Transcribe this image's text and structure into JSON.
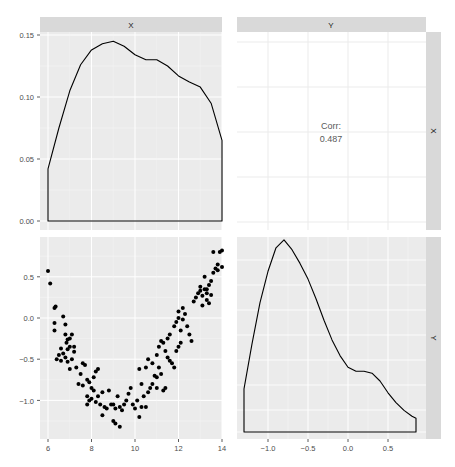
{
  "chart_data": [
    {
      "panel": "top-left",
      "type": "area",
      "title": "",
      "strip_top": "X",
      "xlabel": "",
      "ylabel": "",
      "description": "Density of X",
      "y_ticks": [
        "0.00",
        "0.05",
        "0.10",
        "0.15"
      ],
      "ylim": [
        0,
        0.155
      ],
      "xlim": [
        5.8,
        14.2
      ],
      "x": [
        6.0,
        6.5,
        7.0,
        7.5,
        8.0,
        8.5,
        9.0,
        9.5,
        10.0,
        10.5,
        11.0,
        11.5,
        12.0,
        12.5,
        13.0,
        13.5,
        14.0
      ],
      "values": [
        0.042,
        0.075,
        0.105,
        0.126,
        0.138,
        0.143,
        0.145,
        0.141,
        0.134,
        0.13,
        0.13,
        0.125,
        0.117,
        0.112,
        0.108,
        0.095,
        0.065
      ],
      "grid": true
    },
    {
      "panel": "top-right",
      "type": "table",
      "strip_top": "Y",
      "strip_right": "X",
      "label": "Corr:",
      "value": "0.487"
    },
    {
      "panel": "bottom-left",
      "type": "scatter",
      "xlabel": "",
      "ylabel": "",
      "x_ticks": [
        "6",
        "8",
        "10",
        "12",
        "14"
      ],
      "y_ticks": [
        "-1.0",
        "-0.5",
        "0.0",
        "0.5"
      ],
      "xlim": [
        5.8,
        14.2
      ],
      "ylim": [
        -1.35,
        0.9
      ],
      "grid": true,
      "points": [
        [
          6.0,
          0.57
        ],
        [
          6.1,
          0.42
        ],
        [
          6.3,
          0.12
        ],
        [
          6.35,
          0.14
        ],
        [
          6.3,
          -0.06
        ],
        [
          6.3,
          -0.15
        ],
        [
          6.7,
          0.02
        ],
        [
          6.8,
          -0.08
        ],
        [
          6.8,
          -0.2
        ],
        [
          6.9,
          -0.26
        ],
        [
          6.85,
          -0.3
        ],
        [
          7.0,
          -0.25
        ],
        [
          6.9,
          -0.38
        ],
        [
          7.0,
          -0.35
        ],
        [
          7.2,
          -0.35
        ],
        [
          7.1,
          -0.2
        ],
        [
          6.6,
          -0.37
        ],
        [
          6.5,
          -0.45
        ],
        [
          6.4,
          -0.5
        ],
        [
          6.7,
          -0.43
        ],
        [
          6.6,
          -0.52
        ],
        [
          6.9,
          -0.53
        ],
        [
          6.8,
          -0.48
        ],
        [
          7.1,
          -0.5
        ],
        [
          7.2,
          -0.41
        ],
        [
          7.3,
          -0.6
        ],
        [
          7.0,
          -0.62
        ],
        [
          7.5,
          -0.68
        ],
        [
          7.6,
          -0.55
        ],
        [
          7.7,
          -0.57
        ],
        [
          7.4,
          -0.8
        ],
        [
          7.6,
          -0.82
        ],
        [
          7.8,
          -0.75
        ],
        [
          7.9,
          -0.78
        ],
        [
          8.0,
          -0.85
        ],
        [
          8.1,
          -0.88
        ],
        [
          8.2,
          -0.65
        ],
        [
          8.3,
          -0.62
        ],
        [
          8.1,
          -0.72
        ],
        [
          7.8,
          -0.95
        ],
        [
          7.9,
          -1.0
        ],
        [
          7.8,
          -1.05
        ],
        [
          8.0,
          -0.98
        ],
        [
          8.2,
          -1.02
        ],
        [
          8.3,
          -0.95
        ],
        [
          8.4,
          -1.05
        ],
        [
          8.5,
          -0.9
        ],
        [
          8.6,
          -1.08
        ],
        [
          8.7,
          -1.1
        ],
        [
          8.5,
          -1.18
        ],
        [
          8.8,
          -0.88
        ],
        [
          8.9,
          -1.05
        ],
        [
          9.0,
          -1.05
        ],
        [
          9.1,
          -1.1
        ],
        [
          9.2,
          -0.95
        ],
        [
          9.3,
          -1.08
        ],
        [
          9.4,
          -1.12
        ],
        [
          9.0,
          -1.25
        ],
        [
          9.1,
          -1.28
        ],
        [
          9.3,
          -1.32
        ],
        [
          9.5,
          -1.05
        ],
        [
          9.6,
          -1.0
        ],
        [
          9.7,
          -0.92
        ],
        [
          9.8,
          -0.85
        ],
        [
          9.9,
          -1.05
        ],
        [
          10.0,
          -1.1
        ],
        [
          10.1,
          -1.0
        ],
        [
          10.2,
          -1.2
        ],
        [
          10.3,
          -1.08
        ],
        [
          10.4,
          -0.95
        ],
        [
          10.5,
          -1.08
        ],
        [
          10.6,
          -0.9
        ],
        [
          10.7,
          -0.85
        ],
        [
          10.8,
          -0.8
        ],
        [
          10.9,
          -0.7
        ],
        [
          11.0,
          -0.72
        ],
        [
          10.3,
          -0.8
        ],
        [
          10.2,
          -0.62
        ],
        [
          10.5,
          -0.6
        ],
        [
          10.6,
          -0.5
        ],
        [
          10.8,
          -0.55
        ],
        [
          11.0,
          -0.45
        ],
        [
          11.1,
          -0.6
        ],
        [
          11.2,
          -0.68
        ],
        [
          11.3,
          -0.88
        ],
        [
          11.4,
          -0.85
        ],
        [
          11.0,
          -0.85
        ],
        [
          11.1,
          -0.35
        ],
        [
          11.3,
          -0.3
        ],
        [
          11.4,
          -0.4
        ],
        [
          11.5,
          -0.48
        ],
        [
          11.6,
          -0.52
        ],
        [
          11.7,
          -0.55
        ],
        [
          11.8,
          -0.6
        ],
        [
          11.9,
          -0.4
        ],
        [
          12.0,
          -0.35
        ],
        [
          12.1,
          -0.3
        ],
        [
          11.5,
          -0.25
        ],
        [
          11.2,
          -0.28
        ],
        [
          11.6,
          -0.2
        ],
        [
          11.8,
          -0.1
        ],
        [
          11.9,
          -0.05
        ],
        [
          12.0,
          0.0
        ],
        [
          12.1,
          -0.15
        ],
        [
          12.2,
          -0.02
        ],
        [
          12.3,
          0.05
        ],
        [
          12.4,
          -0.1
        ],
        [
          12.5,
          -0.2
        ],
        [
          12.6,
          -0.28
        ],
        [
          12.0,
          0.08
        ],
        [
          12.2,
          0.12
        ],
        [
          12.7,
          0.2
        ],
        [
          12.8,
          0.25
        ],
        [
          12.9,
          0.3
        ],
        [
          13.0,
          0.33
        ],
        [
          13.1,
          0.27
        ],
        [
          13.2,
          0.35
        ],
        [
          13.3,
          0.3
        ],
        [
          13.4,
          0.4
        ],
        [
          13.3,
          0.22
        ],
        [
          13.5,
          0.45
        ],
        [
          13.0,
          0.38
        ],
        [
          13.2,
          0.5
        ],
        [
          13.6,
          0.55
        ],
        [
          13.7,
          0.6
        ],
        [
          13.8,
          0.65
        ],
        [
          13.9,
          0.8
        ],
        [
          14.0,
          0.82
        ],
        [
          13.6,
          0.8
        ],
        [
          13.8,
          0.58
        ],
        [
          14.0,
          0.62
        ],
        [
          13.1,
          0.15
        ],
        [
          13.4,
          0.18
        ],
        [
          13.3,
          0.35
        ],
        [
          13.5,
          0.28
        ]
      ]
    },
    {
      "panel": "bottom-right",
      "type": "area",
      "strip_right": "Y",
      "description": "Density of Y",
      "x_ticks": [
        "-1.0",
        "-0.5",
        "0.0",
        "0.5"
      ],
      "xlim": [
        -1.38,
        0.98
      ],
      "x": [
        -1.3,
        -1.2,
        -1.1,
        -1.0,
        -0.9,
        -0.8,
        -0.7,
        -0.6,
        -0.5,
        -0.4,
        -0.3,
        -0.2,
        -0.1,
        0.0,
        0.1,
        0.2,
        0.3,
        0.4,
        0.5,
        0.6,
        0.7,
        0.8,
        0.85
      ],
      "values": [
        0.22,
        0.45,
        0.66,
        0.82,
        0.94,
        0.98,
        0.93,
        0.86,
        0.78,
        0.68,
        0.57,
        0.47,
        0.39,
        0.33,
        0.31,
        0.31,
        0.3,
        0.26,
        0.2,
        0.15,
        0.11,
        0.08,
        0.07
      ],
      "grid": true
    }
  ],
  "strips": {
    "top": [
      "X",
      "Y"
    ],
    "right": [
      "X",
      "Y"
    ]
  },
  "corr": {
    "label": "Corr:",
    "value": "0.487"
  },
  "axes": {
    "top_left_y_ticks": [
      "0.15",
      "0.10",
      "0.05",
      "0.00"
    ],
    "bottom_left_y_ticks": [
      "0.5",
      "0.0",
      "-0.5",
      "-1.0"
    ],
    "bottom_x_left_ticks": [
      "6",
      "8",
      "10",
      "12",
      "14"
    ],
    "bottom_x_right_ticks": [
      "-1.0",
      "-0.5",
      "0.0",
      "0.5"
    ]
  },
  "colors": {
    "panel_bg": "#ebebeb",
    "grid": "#ffffff",
    "corr_panel_bg": "#ffffff",
    "corr_grid": "#ebebeb",
    "strip_bg": "#d9d9d9",
    "line": "#000000"
  }
}
